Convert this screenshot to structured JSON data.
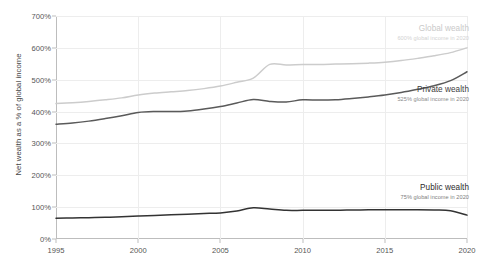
{
  "chart_data": {
    "type": "line",
    "title": "",
    "xlabel": "",
    "ylabel": "Net wealth as a % of global income",
    "xlim": [
      1995,
      2020
    ],
    "ylim": [
      0,
      700
    ],
    "grid": true,
    "legend_position": "inline-right-annotations",
    "x_ticks": [
      "1995",
      "2000",
      "2005",
      "2010",
      "2015",
      "2020"
    ],
    "x_tick_values": [
      1995,
      2000,
      2005,
      2010,
      2015,
      2020
    ],
    "y_ticks": [
      "0%",
      "100%",
      "200%",
      "300%",
      "400%",
      "500%",
      "600%",
      "700%"
    ],
    "y_tick_values": [
      0,
      100,
      200,
      300,
      400,
      500,
      600,
      700
    ],
    "x": [
      1995,
      1996,
      1997,
      1998,
      1999,
      2000,
      2001,
      2002,
      2003,
      2004,
      2005,
      2006,
      2007,
      2008,
      2009,
      2010,
      2011,
      2012,
      2013,
      2014,
      2015,
      2016,
      2017,
      2018,
      2019,
      2020
    ],
    "series": [
      {
        "name": "Global wealth",
        "color": "#cccccc",
        "values": [
          425,
          428,
          432,
          437,
          443,
          452,
          458,
          462,
          466,
          472,
          480,
          492,
          505,
          548,
          546,
          548,
          548,
          549,
          550,
          552,
          555,
          560,
          567,
          575,
          585,
          600
        ]
      },
      {
        "name": "Private wealth",
        "color": "#5a5a5a",
        "values": [
          360,
          364,
          370,
          378,
          387,
          397,
          400,
          400,
          402,
          408,
          416,
          427,
          438,
          432,
          430,
          437,
          436,
          437,
          441,
          446,
          452,
          460,
          470,
          481,
          497,
          525
        ]
      },
      {
        "name": "Public wealth",
        "color": "#333333",
        "values": [
          65,
          66,
          67,
          68,
          70,
          72,
          74,
          76,
          78,
          80,
          82,
          88,
          98,
          94,
          90,
          90,
          90,
          90,
          91,
          92,
          92,
          92,
          92,
          91,
          89,
          75
        ]
      }
    ],
    "annotations": [
      {
        "id": "global",
        "name": "Global wealth",
        "sub": "600% global income in 2020",
        "value_2020": 600
      },
      {
        "id": "private",
        "name": "Private wealth",
        "sub": "525% global income in 2020",
        "value_2020": 525
      },
      {
        "id": "public",
        "name": "Public wealth",
        "sub": "75% global income in 2020",
        "value_2020": 75
      }
    ]
  }
}
